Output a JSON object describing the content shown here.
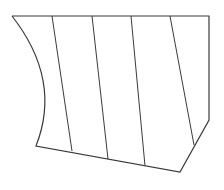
{
  "diagram": {
    "stroke_color": "#3a3a3a",
    "background": "#ffffff",
    "outline": [
      [
        12,
        16
      ],
      [
        209,
        16
      ],
      [
        209,
        120
      ],
      [
        180,
        172
      ],
      [
        36,
        146
      ]
    ],
    "left_curve": {
      "start": [
        36,
        146
      ],
      "control": [
        62,
        80
      ],
      "end": [
        12,
        16
      ]
    },
    "internal_lines": [
      {
        "from": [
          52,
          16
        ],
        "to": [
          72,
          151
        ]
      },
      {
        "from": [
          92,
          16
        ],
        "to": [
          108,
          159
        ]
      },
      {
        "from": [
          131,
          16
        ],
        "to": [
          145,
          166
        ]
      },
      {
        "from": [
          170,
          16
        ],
        "to": [
          194,
          145
        ]
      }
    ]
  }
}
